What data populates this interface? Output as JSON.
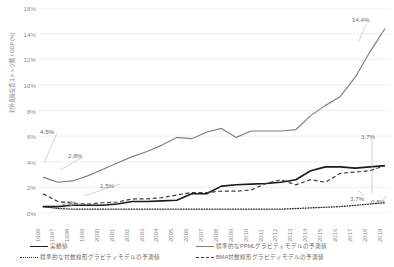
{
  "chart_data": {
    "type": "line",
    "title": "",
    "xlabel": "",
    "ylabel": "対外直接投資ストック額 / GDP (%)",
    "ylim": [
      0,
      16
    ],
    "ytick_labels": [
      "0%",
      "2%",
      "4%",
      "6%",
      "8%",
      "10%",
      "12%",
      "14%",
      "16%"
    ],
    "ytick_values": [
      0,
      2,
      4,
      6,
      8,
      10,
      12,
      14,
      16
    ],
    "grid": true,
    "legend_position": "bottom",
    "categories": [
      "1996",
      "1997",
      "1998",
      "1999",
      "2000",
      "2001",
      "2002",
      "2003",
      "2004",
      "2005",
      "2006",
      "2007",
      "2008",
      "2009",
      "2010",
      "2011",
      "2012",
      "2013",
      "2014",
      "2015",
      "2016",
      "2017",
      "2018",
      "2019"
    ],
    "series": [
      {
        "name": "実績値",
        "style": "solid",
        "color": "#1a1a1a",
        "width": 1.6,
        "values": [
          0.5,
          0.5,
          0.6,
          0.6,
          0.6,
          0.7,
          0.9,
          0.9,
          0.95,
          1.0,
          1.5,
          1.5,
          2.1,
          2.2,
          2.25,
          2.3,
          2.4,
          2.6,
          3.3,
          3.6,
          3.6,
          3.5,
          3.6,
          3.7
        ]
      },
      {
        "name": "標準的なPPMLグラビティモデルの予測値",
        "style": "solid",
        "color": "#808080",
        "width": 1.2,
        "values": [
          2.8,
          2.4,
          2.5,
          2.9,
          3.4,
          3.9,
          4.4,
          4.8,
          5.3,
          5.9,
          5.8,
          6.3,
          6.6,
          5.9,
          6.4,
          6.4,
          6.4,
          6.5,
          7.6,
          8.4,
          9.1,
          10.6,
          12.6,
          14.4
        ]
      },
      {
        "name": "標準的な対数線形グラビティモデルの予測値",
        "style": "dotted",
        "color": "#2b2b2b",
        "width": 1.3,
        "values": [
          0.5,
          0.35,
          0.3,
          0.3,
          0.3,
          0.3,
          0.3,
          0.3,
          0.3,
          0.3,
          0.3,
          0.3,
          0.3,
          0.3,
          0.3,
          0.3,
          0.3,
          0.35,
          0.4,
          0.45,
          0.5,
          0.6,
          0.7,
          0.8
        ]
      },
      {
        "name": "BMA対数線形グラビティモデルの予測値",
        "style": "dashed",
        "color": "#3d3d3d",
        "width": 1.2,
        "values": [
          1.5,
          0.9,
          0.75,
          0.7,
          0.8,
          0.85,
          1.1,
          1.1,
          1.2,
          1.4,
          1.6,
          1.6,
          1.7,
          1.7,
          1.8,
          2.3,
          2.6,
          2.2,
          2.6,
          2.4,
          3.1,
          3.2,
          3.3,
          3.7
        ]
      }
    ],
    "annotations": [
      {
        "id": "a-45",
        "text": "4.5%",
        "x": 40,
        "y": 128
      },
      {
        "id": "a-28",
        "text": "2.8%",
        "x": 68,
        "y": 152
      },
      {
        "id": "a-15",
        "text": "1.5%",
        "x": 100,
        "y": 182
      },
      {
        "id": "a-05",
        "text": "0.5%",
        "x": 62,
        "y": 199
      },
      {
        "id": "a-144",
        "text": "14.4%",
        "x": 352,
        "y": 16
      },
      {
        "id": "a-37t",
        "text": "3.7%",
        "x": 361,
        "y": 133
      },
      {
        "id": "a-37b",
        "text": "3.7%",
        "x": 350,
        "y": 195
      },
      {
        "id": "a-08",
        "text": "0.8%",
        "x": 371,
        "y": 198
      }
    ]
  },
  "legend": {
    "items": [
      {
        "label": "実績値",
        "style": "solid-black"
      },
      {
        "label": "標準的なPPMLグラビティモデルの予測値",
        "style": "solid-gray"
      },
      {
        "label": "標準的な対数線形グラビティモデルの予測値",
        "style": "dotted"
      },
      {
        "label": "BMA対数線形グラビティモデルの予測値",
        "style": "dashed"
      }
    ]
  }
}
